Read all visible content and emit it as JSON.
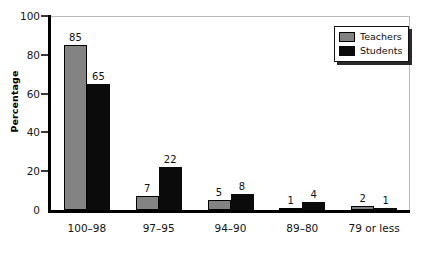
{
  "chart_data": {
    "type": "bar",
    "title": "",
    "xlabel": "",
    "ylabel": "Percentage",
    "ylim": [
      0,
      100
    ],
    "yticks": [
      0,
      20,
      40,
      60,
      80,
      100
    ],
    "grid": false,
    "legend_position": "top-right",
    "categories": [
      "100–98",
      "97–95",
      "94–90",
      "89–80",
      "79 or less"
    ],
    "series": [
      {
        "name": "Teachers",
        "color": "#838383",
        "values": [
          85,
          7,
          5,
          1,
          2
        ]
      },
      {
        "name": "Students",
        "color": "#0b0b0b",
        "values": [
          65,
          22,
          8,
          4,
          1
        ]
      }
    ]
  },
  "legend": {
    "items": [
      {
        "label": "Teachers",
        "swatch": "teachers"
      },
      {
        "label": "Students",
        "swatch": "students"
      }
    ]
  },
  "axis": {
    "y_title": "Percentage",
    "y_tick_labels": [
      "100",
      "80",
      "60",
      "40",
      "20",
      "0"
    ]
  }
}
